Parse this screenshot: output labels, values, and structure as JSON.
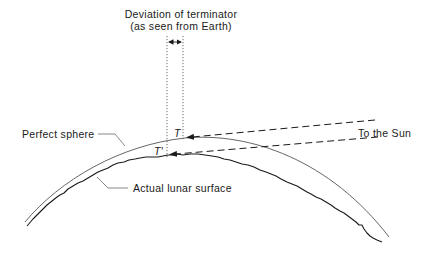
{
  "diagram": {
    "title": {
      "line1": "Deviation of terminator",
      "line2": "(as seen from Earth)"
    },
    "labels": {
      "perfect_sphere": "Perfect sphere",
      "actual_surface": "Actual lunar surface",
      "to_the_sun": "To the Sun",
      "point_t": "T",
      "point_t_prime": "T′"
    },
    "colors": {
      "line": "#1a1a1a",
      "sphere": "#555555",
      "background": "#ffffff"
    },
    "elements": [
      {
        "name": "perfect-sphere-arc",
        "type": "curve",
        "style": "thin solid"
      },
      {
        "name": "actual-lunar-surface",
        "type": "curve",
        "style": "jagged solid"
      },
      {
        "name": "sun-ray-upper",
        "type": "dashed line with arrow",
        "points_to": "T"
      },
      {
        "name": "sun-ray-lower",
        "type": "dashed line with arrow",
        "points_to": "T′"
      },
      {
        "name": "terminator-deviation-marker",
        "type": "dotted verticals with double arrow"
      }
    ]
  }
}
